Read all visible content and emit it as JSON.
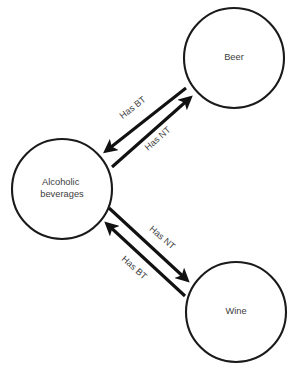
{
  "diagram": {
    "canvas": {
      "width": 293,
      "height": 372,
      "background": "#ffffff"
    },
    "colors": {
      "node_stroke": "#1a1a1a",
      "node_fill": "#ffffff",
      "edge_stroke": "#111111",
      "text": "#3d3d3d"
    },
    "nodes": [
      {
        "id": "beer",
        "label": "Beer",
        "cx": 234,
        "cy": 58,
        "r": 50
      },
      {
        "id": "alcoholic-beverages",
        "label_line1": "Alcoholic",
        "label_line2": "beverages",
        "cx": 62,
        "cy": 189,
        "r": 50
      },
      {
        "id": "wine",
        "label": "Wine",
        "cx": 236,
        "cy": 312,
        "r": 50
      }
    ],
    "edges": [
      {
        "id": "beer-to-alcoholic",
        "label": "Has BT",
        "from": "beer",
        "to": "alcoholic-beverages",
        "x1": 186,
        "y1": 88,
        "x2": 106,
        "y2": 151,
        "label_x": 133,
        "label_y": 108,
        "label_rotate": -38
      },
      {
        "id": "alcoholic-to-beer",
        "label": "Has NT",
        "from": "alcoholic-beverages",
        "to": "beer",
        "x1": 112,
        "y1": 167,
        "x2": 190,
        "y2": 98,
        "label_x": 158,
        "label_y": 139,
        "label_rotate": -41
      },
      {
        "id": "alcoholic-to-wine",
        "label": "Has NT",
        "from": "alcoholic-beverages",
        "to": "wine",
        "x1": 109,
        "y1": 208,
        "x2": 187,
        "y2": 280,
        "label_x": 162,
        "label_y": 238,
        "label_rotate": 41
      },
      {
        "id": "wine-to-alcoholic",
        "label": "Has BT",
        "from": "wine",
        "to": "alcoholic-beverages",
        "x1": 185,
        "y1": 296,
        "x2": 107,
        "y2": 224,
        "label_x": 134,
        "label_y": 268,
        "label_rotate": 42
      }
    ]
  }
}
